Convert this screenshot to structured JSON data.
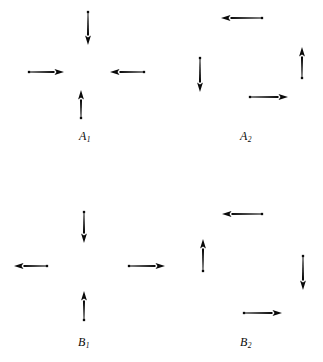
{
  "figure": {
    "width": 323,
    "height": 362,
    "background": "#ffffff",
    "ink_color": "#0a0a0a"
  },
  "panels": [
    {
      "id": "A1",
      "label_text": "A",
      "label_sub": "1",
      "label_x": 79,
      "label_y": 130,
      "pattern": "inward",
      "pattern_name": "convergent node (all arrows point toward the centre)",
      "center_x": 88,
      "center_y": 72,
      "arrows": [
        {
          "name": "top-arrow",
          "direction": "down",
          "tail_x": 88,
          "tail_y": 12,
          "head_x": 88,
          "head_y": 45
        },
        {
          "name": "left-arrow",
          "direction": "right",
          "tail_x": 29,
          "tail_y": 72,
          "head_x": 64,
          "head_y": 72
        },
        {
          "name": "right-arrow",
          "direction": "left",
          "tail_x": 144,
          "tail_y": 72,
          "head_x": 110,
          "head_y": 72
        },
        {
          "name": "bottom-arrow",
          "direction": "up",
          "tail_x": 81,
          "tail_y": 118,
          "head_x": 81,
          "head_y": 90
        }
      ]
    },
    {
      "id": "A2",
      "label_text": "A",
      "label_sub": "2",
      "label_x": 240,
      "label_y": 130,
      "pattern": "clockwise",
      "pattern_name": "clockwise circulation (rotational field)",
      "center_x": 252,
      "center_y": 68,
      "arrows": [
        {
          "name": "top-arrow",
          "direction": "left",
          "tail_x": 262,
          "tail_y": 18,
          "head_x": 221,
          "head_y": 18
        },
        {
          "name": "left-arrow",
          "direction": "down",
          "tail_x": 200,
          "tail_y": 58,
          "head_x": 200,
          "head_y": 92
        },
        {
          "name": "right-arrow",
          "direction": "up",
          "tail_x": 302,
          "tail_y": 78,
          "head_x": 302,
          "head_y": 47
        },
        {
          "name": "bottom-arrow",
          "direction": "right",
          "tail_x": 250,
          "tail_y": 97,
          "head_x": 288,
          "head_y": 97
        }
      ]
    },
    {
      "id": "B1",
      "label_text": "B",
      "label_sub": "1",
      "label_x": 78,
      "label_y": 336,
      "pattern": "saddle",
      "pattern_name": "saddle point (vertical arrows inward, horizontal arrows outward)",
      "center_x": 88,
      "center_y": 268,
      "arrows": [
        {
          "name": "top-arrow",
          "direction": "down",
          "tail_x": 84,
          "tail_y": 212,
          "head_x": 84,
          "head_y": 243
        },
        {
          "name": "left-arrow",
          "direction": "left",
          "tail_x": 47,
          "tail_y": 266,
          "head_x": 14,
          "head_y": 266
        },
        {
          "name": "right-arrow",
          "direction": "right",
          "tail_x": 129,
          "tail_y": 266,
          "head_x": 165,
          "head_y": 266
        },
        {
          "name": "bottom-arrow",
          "direction": "up",
          "tail_x": 84,
          "tail_y": 320,
          "head_x": 84,
          "head_y": 291
        }
      ]
    },
    {
      "id": "B2",
      "label_text": "B",
      "label_sub": "2",
      "label_x": 240,
      "label_y": 336,
      "pattern": "counterclockwise",
      "pattern_name": "counter-clockwise circulation (rotational field)",
      "center_x": 252,
      "center_y": 268,
      "arrows": [
        {
          "name": "top-arrow",
          "direction": "left",
          "tail_x": 262,
          "tail_y": 214,
          "head_x": 222,
          "head_y": 214
        },
        {
          "name": "left-arrow",
          "direction": "up",
          "tail_x": 203,
          "tail_y": 271,
          "head_x": 203,
          "head_y": 239
        },
        {
          "name": "right-arrow",
          "direction": "down",
          "tail_x": 303,
          "tail_y": 256,
          "head_x": 303,
          "head_y": 290
        },
        {
          "name": "bottom-arrow",
          "direction": "right",
          "tail_x": 244,
          "tail_y": 313,
          "head_x": 282,
          "head_y": 313
        }
      ]
    }
  ]
}
